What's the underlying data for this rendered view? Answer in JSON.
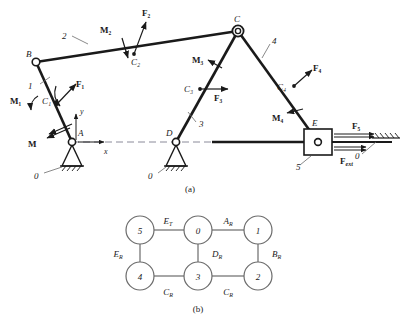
{
  "figure": {
    "caption_a": "(a)",
    "caption_b": "(b)"
  },
  "mechanism": {
    "joints": [
      {
        "name": "B",
        "label": "B",
        "x": 36,
        "y": 62,
        "type": "pin"
      },
      {
        "name": "C",
        "label": "C",
        "x": 238,
        "y": 31,
        "type": "double-pin"
      },
      {
        "name": "A",
        "label": "A",
        "x": 72,
        "y": 142,
        "type": "ground-pin"
      },
      {
        "name": "D",
        "label": "D",
        "x": 176,
        "y": 142,
        "type": "ground-pin"
      },
      {
        "name": "E",
        "label": "E",
        "x": 318,
        "y": 142,
        "type": "slider-pin"
      }
    ],
    "link_numbers": [
      {
        "label": "1",
        "x": 30,
        "y": 86
      },
      {
        "label": "2",
        "x": 64,
        "y": 36
      },
      {
        "label": "3",
        "x": 198,
        "y": 124
      },
      {
        "label": "4",
        "x": 272,
        "y": 42
      },
      {
        "label": "5",
        "x": 308,
        "y": 166
      }
    ],
    "ground_labels": [
      {
        "label": "0",
        "x": 35,
        "y": 176
      },
      {
        "label": "0",
        "x": 150,
        "y": 176
      },
      {
        "label": "0",
        "x": 370,
        "y": 156
      }
    ],
    "centers": [
      {
        "label": "C₁",
        "x": 46,
        "y": 100
      },
      {
        "label": "C₂",
        "x": 134,
        "y": 61
      },
      {
        "label": "C₃",
        "x": 186,
        "y": 88
      },
      {
        "label": "C₄",
        "x": 283,
        "y": 90
      }
    ],
    "forces": [
      {
        "label": "F₁",
        "x": 75,
        "y": 86
      },
      {
        "label": "F₂",
        "x": 144,
        "y": 13
      },
      {
        "label": "F₃",
        "x": 220,
        "y": 98
      },
      {
        "label": "F₄",
        "x": 315,
        "y": 73
      },
      {
        "label": "F₅",
        "x": 355,
        "y": 128
      },
      {
        "label": "F",
        "sub": "ext",
        "x": 352,
        "y": 161
      }
    ],
    "moments": [
      {
        "label": "M₁",
        "x": 16,
        "y": 101
      },
      {
        "label": "M₂",
        "x": 106,
        "y": 30
      },
      {
        "label": "M₃",
        "x": 198,
        "y": 60
      },
      {
        "label": "M₄",
        "x": 277,
        "y": 117
      },
      {
        "label": "M",
        "x": 32,
        "y": 134
      }
    ],
    "axes": [
      {
        "label": "x",
        "x": 107,
        "y": 152
      },
      {
        "label": "y",
        "x": 81,
        "y": 109
      }
    ]
  },
  "graph": {
    "nodes": [
      {
        "id": "5",
        "label": "5",
        "cx": 140,
        "cy": 230
      },
      {
        "id": "0",
        "label": "0",
        "cx": 198,
        "cy": 230
      },
      {
        "id": "1",
        "label": "1",
        "cx": 258,
        "cy": 230
      },
      {
        "id": "4",
        "label": "4",
        "cx": 140,
        "cy": 276
      },
      {
        "id": "3",
        "label": "3",
        "cx": 198,
        "cy": 276
      },
      {
        "id": "2",
        "label": "2",
        "cx": 258,
        "cy": 276
      }
    ],
    "edges": [
      {
        "from": "5",
        "to": "0",
        "label": "E",
        "sub": "T",
        "lx": 168,
        "ly": 221
      },
      {
        "from": "0",
        "to": "1",
        "label": "A",
        "sub": "R",
        "lx": 228,
        "ly": 221
      },
      {
        "from": "5",
        "to": "4",
        "label": "E",
        "sub": "R",
        "lx": 125,
        "ly": 254
      },
      {
        "from": "0",
        "to": "3",
        "label": "D",
        "sub": "R",
        "lx": 212,
        "ly": 254
      },
      {
        "from": "1",
        "to": "2",
        "label": "B",
        "sub": "R",
        "lx": 275,
        "ly": 254
      },
      {
        "from": "4",
        "to": "3",
        "label": "C",
        "sub": "R",
        "lx": 168,
        "ly": 291
      },
      {
        "from": "3",
        "to": "2",
        "label": "C",
        "sub": "R",
        "lx": 228,
        "ly": 291
      }
    ],
    "node_radius": 14
  },
  "colors": {
    "line": "#1a1a1a",
    "graph_line": "#6b6b6b",
    "dashed": "#8a8a99",
    "background": "#ffffff"
  }
}
